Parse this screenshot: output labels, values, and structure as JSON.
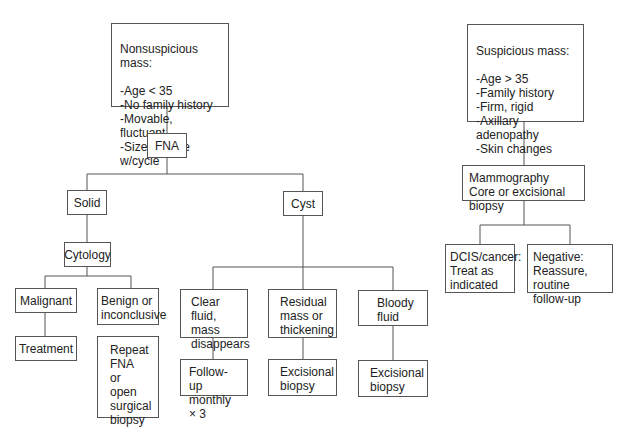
{
  "diagram": {
    "nonsuspicious": {
      "title": "Nonsuspicious mass:",
      "criteria": "-Age < 35\n-No family history\n-Movable, fluctuant\n-Size change w/cycle"
    },
    "suspicious": {
      "title": "Suspicious mass:",
      "criteria": "-Age > 35\n-Family history\n-Firm, rigid\n-Axillary adenopathy\n-Skin changes"
    },
    "fna": "FNA",
    "solid": "Solid",
    "cyst": "Cyst",
    "cytology": "Cytology",
    "malignant": "Malignant",
    "treatment": "Treatment",
    "benign": "Benign or\ninconclusive",
    "repeat_fna": "Repeat\nFNA or\nopen\nsurgical\nbiopsy",
    "clear_fluid": "Clear fluid,\nmass\ndisappears",
    "follow_up": "Follow-up\nmonthly × 3",
    "residual_mass": "Residual\nmass or\nthickening",
    "excisional_1": "Excisional\nbiopsy",
    "bloody_fluid": "Bloody\nfluid",
    "excisional_2": "Excisional\nbiopsy",
    "mammography": "Mammography\nCore or excisional biopsy",
    "dcis": "DCIS/cancer:\nTreat as\nindicated",
    "negative": "Negative:\nReassure,\nroutine follow-up"
  }
}
